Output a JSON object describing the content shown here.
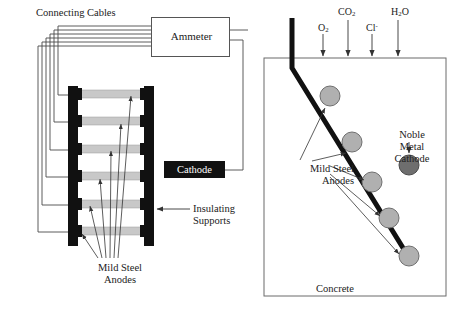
{
  "figure": {
    "colors": {
      "ink": "#1a1a1a",
      "rail_black": "#111111",
      "anode_gray": "#c8c8c8",
      "circle_anode_gray": "#b0b0b0",
      "circle_cathode_gray": "#6e6e6e",
      "box_border": "#555555",
      "wire": "#4a4a4a",
      "background": "#ffffff"
    }
  },
  "left_panel": {
    "connecting_cables_label": "Connecting Cables",
    "ammeter_label": "Ammeter",
    "cathode_label": "Cathode",
    "insulating_supports_label": "Insulating\nSupports",
    "insulating_supports_line1": "Insulating",
    "insulating_supports_line2": "Supports",
    "mild_steel_anodes_line1": "Mild Steel",
    "mild_steel_anodes_line2": "Anodes",
    "rung_count": 6,
    "cable_loop_count": 6
  },
  "right_panel": {
    "concrete_label": "Concrete",
    "noble_metal_cathode_line1": "Noble",
    "noble_metal_cathode_line2": "Metal",
    "noble_metal_cathode_line3": "Cathode",
    "mild_steel_anodes_line1": "Mild Steel",
    "mild_steel_anodes_line2": "Anodes",
    "anode_circle_count": 5,
    "cathode_circle_count": 1,
    "species": [
      {
        "name": "oxygen",
        "formula_main": "O",
        "formula_sub": "2",
        "formula_sup": ""
      },
      {
        "name": "carbon-dioxide",
        "formula_main": "CO",
        "formula_sub": "2",
        "formula_sup": ""
      },
      {
        "name": "chloride",
        "formula_main": "Cl",
        "formula_sub": "",
        "formula_sup": "-"
      },
      {
        "name": "water",
        "formula_main": "H",
        "formula_sub": "2",
        "formula_sup": "",
        "formula_tail": "O"
      }
    ]
  }
}
